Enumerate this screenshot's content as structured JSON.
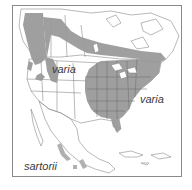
{
  "map": {
    "title": "",
    "region": "North America",
    "colors": {
      "range_fill": "#9a9a9a",
      "minor_range_fill": "#b5b5b5",
      "border": "#7a7a7a",
      "land": "#ffffff",
      "frame": "#8a8a8a",
      "label": "#3a3a3a"
    },
    "labels": [
      {
        "id": "varia-west",
        "text": "varia",
        "x": 52,
        "y": 64
      },
      {
        "id": "varia-east",
        "text": "varia",
        "x": 140,
        "y": 94
      },
      {
        "id": "sartorii",
        "text": "sartorii",
        "x": 24,
        "y": 161
      }
    ]
  }
}
